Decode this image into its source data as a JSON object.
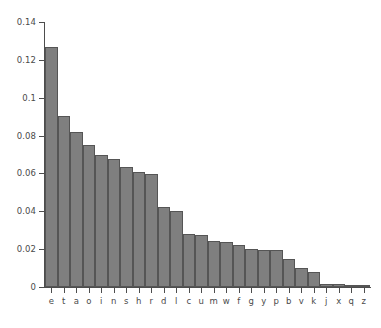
{
  "chart_data": {
    "type": "bar",
    "title": "",
    "subtitle": "",
    "xlabel": "",
    "ylabel": "",
    "xlim_note": "categorical, 26 letters sorted by descending frequency",
    "ylim": [
      0,
      0.14
    ],
    "grid": false,
    "legend": null,
    "bar_fill_color": "#7f7f7f",
    "bar_edge_color": "#555555",
    "axis_color": "#4d4d4d",
    "background_color": "#ffffff",
    "ytick_labels": [
      "0",
      "0.02",
      "0.04",
      "0.06",
      "0.08",
      "0.1",
      "0.12",
      "0.14"
    ],
    "ytick_values": [
      0,
      0.02,
      0.04,
      0.06,
      0.08,
      0.1,
      0.12,
      0.14
    ],
    "categories": [
      "e",
      "t",
      "a",
      "o",
      "i",
      "n",
      "s",
      "h",
      "r",
      "d",
      "l",
      "c",
      "u",
      "m",
      "w",
      "f",
      "g",
      "y",
      "p",
      "b",
      "v",
      "k",
      "j",
      "x",
      "q",
      "z"
    ],
    "values": [
      0.127,
      0.0906,
      0.0817,
      0.0751,
      0.0697,
      0.0675,
      0.0633,
      0.0609,
      0.0599,
      0.0425,
      0.0403,
      0.0278,
      0.0276,
      0.0241,
      0.0236,
      0.0223,
      0.0202,
      0.0197,
      0.0193,
      0.0149,
      0.0098,
      0.0077,
      0.0015,
      0.0015,
      0.001,
      0.0007
    ]
  }
}
